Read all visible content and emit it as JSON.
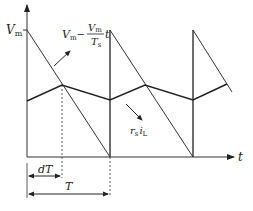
{
  "diagram": {
    "type": "pwm-waveform",
    "axes": {
      "y_label": "V",
      "y_label_sub": "m",
      "x_label": "t"
    },
    "sawtooth_label": {
      "lhs": "V",
      "lhs_sub": "m",
      "minus": "−",
      "num": "V",
      "num_sub": "m",
      "den": "T",
      "den_sub": "s",
      "var": "t"
    },
    "triangle_label": {
      "r": "r",
      "r_sub": "s",
      "i": "i",
      "i_sub": "L"
    },
    "dimensions": {
      "duty": "dT",
      "period": "T"
    },
    "colors": {
      "line": "#222222",
      "axis": "#333333",
      "background": "#ffffff"
    }
  }
}
